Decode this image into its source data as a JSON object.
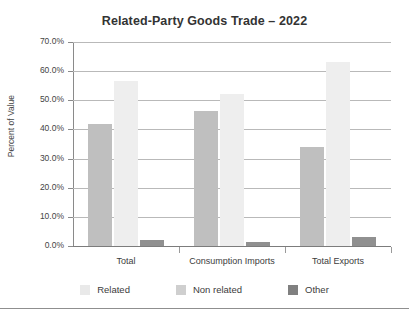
{
  "chart_data": {
    "type": "bar",
    "title": "Related-Party Goods Trade – 2022",
    "xlabel": "",
    "ylabel": "Percent of Value",
    "ylim": [
      0,
      70
    ],
    "ytick_labels": [
      "70.0%",
      "60.0%",
      "50.0%",
      "40.0%",
      "30.0%",
      "20.0%",
      "10.0%",
      "0.0%"
    ],
    "ytick_values": [
      70,
      60,
      50,
      40,
      30,
      20,
      10,
      0
    ],
    "grid": true,
    "legend_position": "bottom",
    "categories": [
      "Total",
      "Consumption Imports",
      "Total Exports"
    ],
    "series": [
      {
        "name": "Related",
        "color": "#bfbfbf",
        "values": [
          42.0,
          46.5,
          34.0
        ]
      },
      {
        "name": "Non related",
        "color": "#eeeeee",
        "values": [
          56.5,
          52.0,
          63.0
        ]
      },
      {
        "name": "Other",
        "color": "#909090",
        "values": [
          2.0,
          1.3,
          3.0
        ]
      }
    ]
  }
}
